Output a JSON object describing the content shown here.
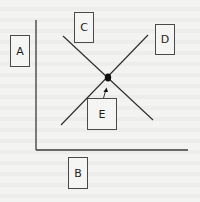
{
  "diagram": {
    "type": "two-crossing-lines-on-axes",
    "colors": {
      "background": "#f3f3f2",
      "stroke": "#2b2b2b",
      "box_border": "#4a4a4a",
      "text": "#1d1d1d"
    },
    "labels": {
      "A": "A",
      "B": "B",
      "C": "C",
      "D": "D",
      "E": "E"
    },
    "boxes": [
      {
        "id": "A",
        "role": "y-axis-label",
        "x": 10,
        "y": 35,
        "w": 20,
        "h": 32
      },
      {
        "id": "B",
        "role": "x-axis-label",
        "x": 68,
        "y": 157,
        "w": 20,
        "h": 32
      },
      {
        "id": "C",
        "role": "descending-line-label",
        "x": 74,
        "y": 12,
        "w": 20,
        "h": 31
      },
      {
        "id": "D",
        "role": "ascending-line-label",
        "x": 155,
        "y": 24,
        "w": 20,
        "h": 31
      },
      {
        "id": "E",
        "role": "intersection-point-label",
        "x": 87,
        "y": 98,
        "w": 30,
        "h": 32
      }
    ],
    "axes": {
      "origin": [
        36,
        150
      ],
      "y_axis_top": [
        36,
        20
      ],
      "x_axis_right": [
        188,
        150
      ]
    },
    "lines": {
      "descending": {
        "from": [
          63,
          36
        ],
        "to": [
          153,
          120
        ]
      },
      "ascending": {
        "from": [
          61,
          125
        ],
        "to": [
          148,
          35
        ]
      }
    },
    "intersection": {
      "x": 108,
      "y": 78
    },
    "arrow": {
      "from": [
        104,
        98
      ],
      "to": [
        106,
        89
      ]
    }
  }
}
